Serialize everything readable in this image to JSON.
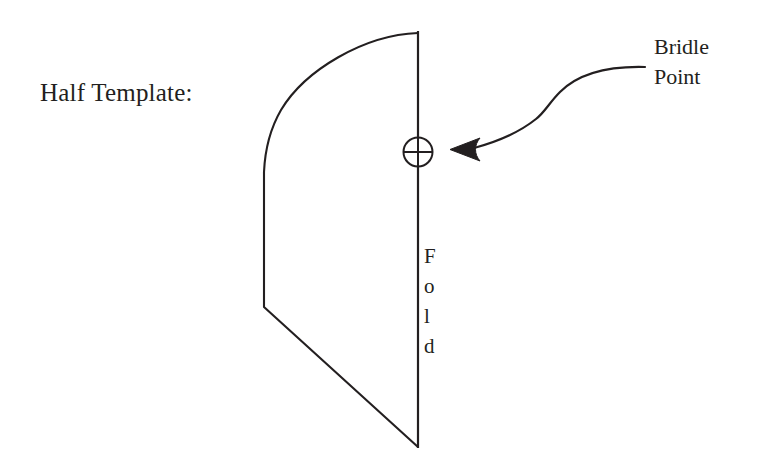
{
  "page": {
    "background_color": "#ffffff",
    "ink_color": "#231f20",
    "width": 757,
    "height": 469
  },
  "labels": {
    "half_template": "Half Template:",
    "bridle_point_line1": "Bridle",
    "bridle_point_line2": "Point",
    "fold_letters": [
      "F",
      "o",
      "l",
      "d"
    ],
    "fold_word": "Fold"
  },
  "diagram": {
    "shape_name": "half-template-outline",
    "fold_line_name": "fold-line",
    "bridle_marker_name": "bridle-point-marker",
    "pointer_name": "bridle-point-pointer",
    "stroke_color": "#231f20",
    "stroke_width": 2,
    "fold_line": {
      "x": 418,
      "y_top": 32,
      "y_bottom": 447
    },
    "arc": {
      "start_x": 418,
      "start_y": 33,
      "end_x": 264,
      "end_y": 172
    },
    "left_edge": {
      "x": 264,
      "y_top": 172,
      "y_bottom": 307
    },
    "diagonal": {
      "x1": 264,
      "y1": 307,
      "x2": 418,
      "y2": 447
    },
    "bridle_marker": {
      "cx": 418,
      "cy": 152,
      "r": 15
    },
    "pointer": {
      "tip_x": 450,
      "tip_y": 150,
      "tail_x": 645,
      "tail_y": 67
    }
  }
}
